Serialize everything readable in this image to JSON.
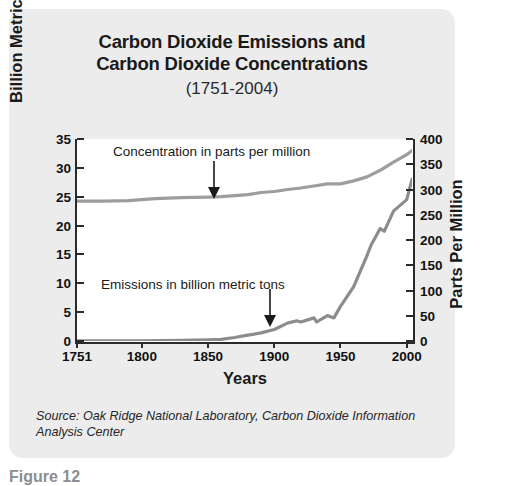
{
  "panel": {
    "background_color": "#ececed"
  },
  "title": {
    "line1": "Carbon Dioxide Emissions and",
    "line2": "Carbon Dioxide Concentrations",
    "subtitle": "(1751-2004)"
  },
  "source": {
    "text": "Source: Oak Ridge National Laboratory, Carbon Dioxide Information Analysis Center"
  },
  "caption": {
    "text": "Figure 12"
  },
  "axes": {
    "left_title_main": "Billion Metric Tons CO",
    "left_title_sub": "2",
    "right_title": "Parts Per Million",
    "x_title": "Years"
  },
  "annotations": {
    "concentration": "Concentration in parts per million",
    "emissions": "Emissions in billion metric tons"
  },
  "chart_data": {
    "type": "line",
    "title": "Carbon Dioxide Emissions and Carbon Dioxide Concentrations (1751-2004)",
    "xlabel": "Years",
    "ylabel": "Billion Metric Tons CO2",
    "ylabel_right": "Parts Per Million",
    "xlim": [
      1751,
      2004
    ],
    "ylim": [
      0,
      35
    ],
    "ylim_right": [
      0,
      400
    ],
    "xticks": [
      1751,
      1800,
      1850,
      1900,
      1950,
      2000
    ],
    "yticks": [
      0,
      5,
      10,
      15,
      20,
      25,
      30,
      35
    ],
    "yticks_right": [
      0,
      50,
      100,
      150,
      200,
      250,
      300,
      350,
      400
    ],
    "grid": false,
    "legend": "annotations-with-arrows",
    "colors": {
      "concentration_line": "#9a9a9a",
      "emissions_line": "#8a8a8a",
      "axis": "#2a2a2a",
      "plot_background": "#ffffff"
    },
    "series": [
      {
        "name": "Concentration in parts per million",
        "axis": "right",
        "units": "ppm",
        "x": [
          1751,
          1770,
          1790,
          1810,
          1830,
          1850,
          1860,
          1870,
          1880,
          1890,
          1900,
          1910,
          1920,
          1930,
          1940,
          1950,
          1960,
          1970,
          1980,
          1990,
          2000,
          2004
        ],
        "values": [
          277,
          277,
          278,
          282,
          284,
          285,
          286,
          288,
          290,
          294,
          296,
          300,
          303,
          307,
          311,
          311,
          317,
          325,
          338,
          354,
          369,
          377
        ]
      },
      {
        "name": "Emissions in billion metric tons",
        "axis": "left",
        "units": "billion metric tons CO2",
        "x": [
          1751,
          1800,
          1830,
          1850,
          1860,
          1870,
          1880,
          1890,
          1900,
          1910,
          1917,
          1920,
          1930,
          1932,
          1940,
          1945,
          1950,
          1960,
          1970,
          1973,
          1980,
          1983,
          1990,
          2000,
          2004
        ],
        "values": [
          0.01,
          0.03,
          0.1,
          0.2,
          0.3,
          0.6,
          1.0,
          1.4,
          2.0,
          3.1,
          3.5,
          3.3,
          4.0,
          3.3,
          4.4,
          4.0,
          6.0,
          9.4,
          14.8,
          16.6,
          19.5,
          19.0,
          22.5,
          24.5,
          28.0
        ]
      }
    ],
    "arrow_annotations": [
      {
        "label": "Concentration in parts per million",
        "points_to_year": 1851,
        "points_to_value_ppm": 285
      },
      {
        "label": "Emissions in billion metric tons",
        "points_to_year": 1893,
        "points_to_value": 1.5
      }
    ]
  }
}
